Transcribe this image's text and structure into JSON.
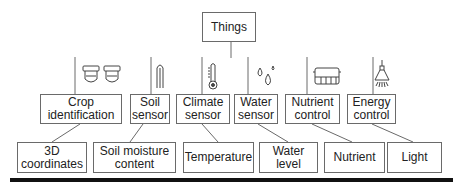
{
  "root": {
    "label": "Things"
  },
  "categories": [
    {
      "label": "Crop\nidentification",
      "icon": "camera-pair-icon",
      "child": "3D\ncoordinates"
    },
    {
      "label": "Soil\nsensor",
      "icon": "soil-probe-icon",
      "child": "Soil moisture\ncontent"
    },
    {
      "label": "Climate\nsensor",
      "icon": "thermometer-icon",
      "child": "Temperature"
    },
    {
      "label": "Water\nsensor",
      "icon": "water-drops-icon",
      "child": "Water level"
    },
    {
      "label": "Nutrient\ncontrol",
      "icon": "nutrient-controller-icon",
      "child": "Nutrient"
    },
    {
      "label": "Energy\ncontrol",
      "icon": "lamp-icon",
      "child": "Light"
    }
  ],
  "colors": {
    "line": "#6a6a6a",
    "bar": "#111111"
  }
}
